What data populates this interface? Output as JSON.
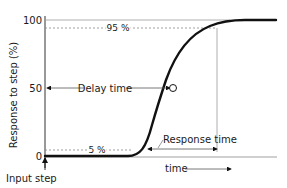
{
  "diagram": {
    "y_axis_label": "Response to step  (%)",
    "y_ticks": [
      "100",
      "50",
      "0"
    ],
    "level_labels": {
      "upper": "95 %",
      "lower": "5 %"
    },
    "annotations": {
      "delay_time": "Delay time",
      "response_time": "Response time",
      "time_axis": "time",
      "input_step": "Input step"
    },
    "colors": {
      "curve": "#111111",
      "guide": "#9a9a9a",
      "text": "#1a1a1a"
    }
  }
}
